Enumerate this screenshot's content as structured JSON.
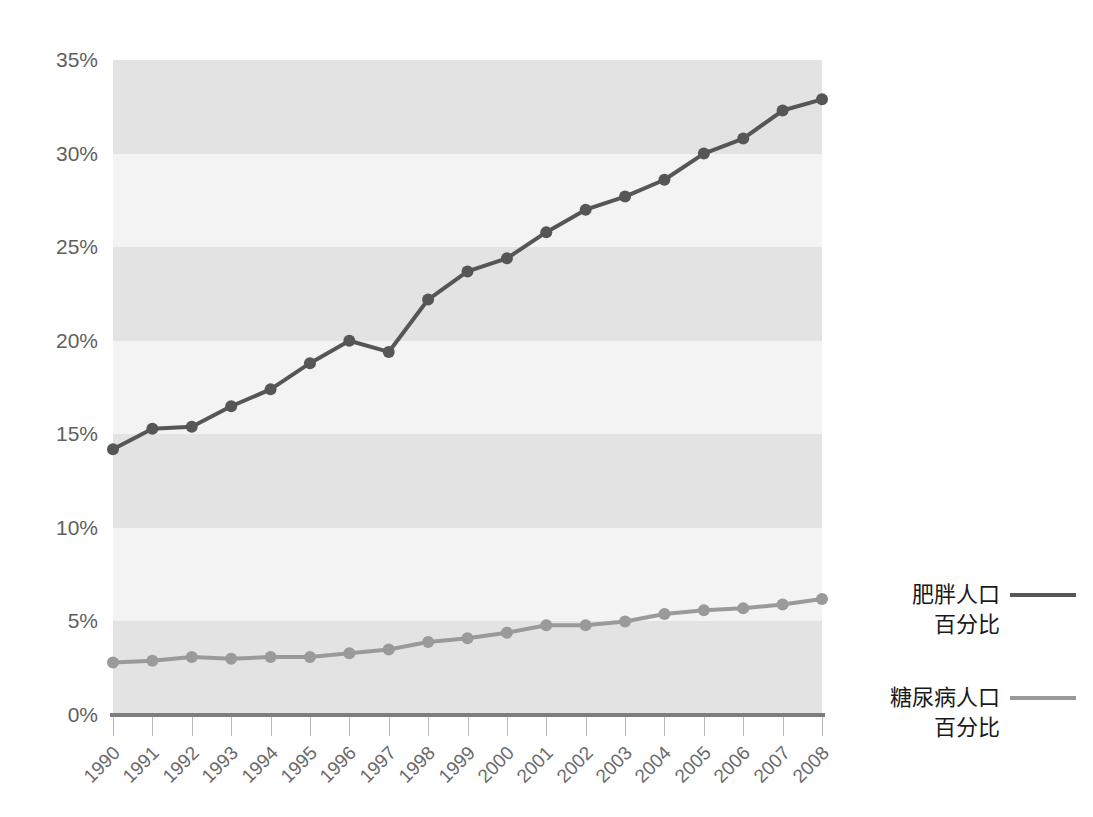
{
  "chart_data": {
    "type": "line",
    "title": "",
    "xlabel": "",
    "ylabel": "",
    "grid": "horizontal-bands",
    "legend_position": "right",
    "ylim": [
      0,
      35
    ],
    "ytick_labels": [
      "35%",
      "30%",
      "25%",
      "20%",
      "15%",
      "10%",
      "5%",
      "0%"
    ],
    "ytick_values": [
      35,
      30,
      25,
      20,
      15,
      10,
      5,
      0
    ],
    "categories": [
      "1990",
      "1991",
      "1992",
      "1993",
      "1994",
      "1995",
      "1996",
      "1997",
      "1998",
      "1999",
      "2000",
      "2001",
      "2002",
      "2003",
      "2004",
      "2005",
      "2006",
      "2007",
      "2008"
    ],
    "series": [
      {
        "name": "肥胖人口\n百分比",
        "name_line1": "肥胖人口",
        "name_line2": "百分比",
        "color": "#565656",
        "values": [
          14.2,
          15.3,
          15.4,
          16.5,
          17.4,
          18.8,
          20.0,
          19.4,
          22.2,
          23.7,
          24.4,
          25.8,
          27.0,
          27.7,
          28.6,
          30.0,
          30.8,
          32.3,
          32.9
        ]
      },
      {
        "name": "糖尿病人口\n百分比",
        "name_line1": "糖尿病人口",
        "name_line2": "百分比",
        "color": "#9a9a9a",
        "values": [
          2.8,
          2.9,
          3.1,
          3.0,
          3.1,
          3.1,
          3.3,
          3.5,
          3.9,
          4.1,
          4.4,
          4.8,
          4.8,
          5.0,
          5.4,
          5.6,
          5.7,
          5.9,
          6.2
        ]
      }
    ],
    "band_color_dark": "#e3e3e3",
    "band_color_light": "#f3f3f3",
    "axis_color": "#7d7d7d",
    "tick_label_color": "#6a6a6a"
  },
  "legend": {
    "entries": [
      {
        "line1": "肥胖人口",
        "line2": "百分比",
        "color": "#565656"
      },
      {
        "line1": "糖尿病人口",
        "line2": "百分比",
        "color": "#9a9a9a"
      }
    ]
  }
}
